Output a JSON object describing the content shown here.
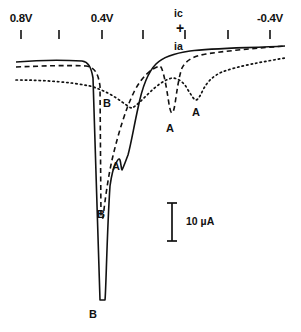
{
  "figure": {
    "axis": {
      "name": "potential-axis",
      "orientation": "top",
      "labels": [
        {
          "text": "0.8V",
          "x": 21,
          "y": 20
        },
        {
          "text": "0.4V",
          "x": 102,
          "y": 20
        },
        {
          "text": "-0.4V",
          "x": 270,
          "y": 20
        }
      ],
      "ticks": [
        {
          "x": 21
        },
        {
          "x": 59
        },
        {
          "x": 102
        },
        {
          "x": 143
        },
        {
          "x": 185
        },
        {
          "x": 228
        },
        {
          "x": 270
        }
      ],
      "tick_y": 30,
      "tick_length": 9
    },
    "current_axis": {
      "cathodic_label": "ic",
      "cathodic_x": 180,
      "cathodic_y": 13,
      "plus_symbol": "+",
      "plus_x": 181,
      "plus_y": 28,
      "anodic_label": "ia",
      "anodic_x": 180,
      "anodic_y": 46
    },
    "scale_bar": {
      "name": "current-scale-bar",
      "text": "10 µA",
      "line_x": 172,
      "line_top": 203,
      "line_bottom": 241,
      "cap_half_width": 5,
      "label_x": 186,
      "label_y": 215
    },
    "peak_labels": [
      {
        "text": "B",
        "x": 103,
        "y": 97,
        "curve": "dashed"
      },
      {
        "text": "A",
        "x": 112,
        "y": 160,
        "curve": "solid"
      },
      {
        "text": "B",
        "x": 97,
        "y": 208,
        "curve": "dashed-lower"
      },
      {
        "text": "A",
        "x": 166,
        "y": 122,
        "curve": "dashed"
      },
      {
        "text": "A",
        "x": 192,
        "y": 106,
        "curve": "dotted"
      },
      {
        "text": "B",
        "x": 89,
        "y": 308,
        "curve": "solid"
      }
    ],
    "curves": [
      {
        "name": "solid-curve",
        "style": "solid",
        "stroke": "#111111",
        "width": 1.6,
        "path": "M 16,62 C 40,60 64,60 82,61 C 88,62 91,66 93,78 L 100,300 L 105,300 C 106,292 107,230 110,186 C 112,172 114,166 116,163 C 118,159 119,158 120,160 C 121,163 121,168 122,170 C 124,166 126,160 128,155 C 131,144 134,126 138,108 C 142,88 148,72 156,64 C 164,56 176,53 190,51 C 214,48 250,48 285,46"
      },
      {
        "name": "dashed-curve",
        "style": "dashed",
        "stroke": "#111111",
        "width": 1.6,
        "dasharray": "5,3.5",
        "path": "M 16,67 C 42,66 66,65 86,66 C 94,67 98,72 100,86 L 101,218 L 103,218 C 105,200 108,178 112,160 C 118,134 126,108 134,92 C 142,76 152,68 160,66 C 163,68 166,84 169,104 C 170,110 171,113 172,113 C 173,113 174,110 175,104 C 177,90 179,76 182,68 C 186,60 194,56 206,54 C 232,50 260,48 285,46"
      },
      {
        "name": "dotted-curve",
        "style": "dotted",
        "stroke": "#111111",
        "width": 1.7,
        "dasharray": "1.4,3.2",
        "path": "M 16,80 C 44,80 70,82 90,86 C 104,90 114,96 122,102 C 128,106 130,108 132,108 C 136,106 142,100 148,94 C 156,86 164,80 172,78 C 178,78 184,82 188,90 C 192,96 194,100 196,100 C 198,100 200,96 203,90 C 207,82 213,76 222,72 C 238,66 262,62 285,58"
      }
    ],
    "colors": {
      "ink": "#111111",
      "background": "#ffffff"
    }
  }
}
